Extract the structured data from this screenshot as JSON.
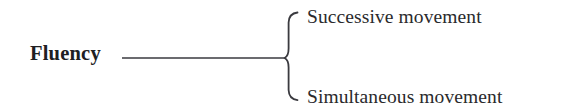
{
  "diagram": {
    "type": "bracket-tree",
    "background_color": "#ffffff",
    "stroke_color": "#3a3a3f",
    "text_color": "#2a2a2c",
    "root": {
      "label": "Fluency",
      "style": "bold-serif"
    },
    "connector": {
      "name": "horizontal-line",
      "from_x": 122,
      "to_x": 286,
      "y": 58
    },
    "brace": {
      "name": "curly-brace",
      "orientation": "left-pointing",
      "top_y": 12,
      "bottom_y": 100,
      "middle_y": 58,
      "stem_x": 288,
      "tip_x": 298
    },
    "branches": [
      {
        "label": "Successive movement"
      },
      {
        "label": "Simultaneous movement"
      }
    ]
  }
}
